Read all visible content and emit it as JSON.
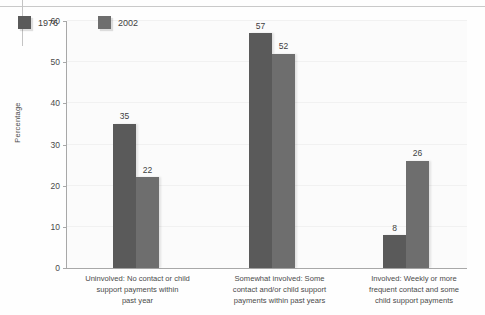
{
  "chart_data": {
    "type": "bar",
    "title": "",
    "subtitle": "",
    "xlabel": "",
    "ylabel": "Percentage",
    "ylim": [
      0,
      60
    ],
    "yticks": [
      0,
      10,
      20,
      30,
      40,
      50,
      60
    ],
    "grid": true,
    "legend_position": "top-left",
    "categories": [
      "Uninvolved: No contact or child support payments within past year",
      "Somewhat involved: Some contact and/or child support payments within past years",
      "Involved: Weekly or more frequent contact and some child support payments"
    ],
    "category_lines": [
      [
        "Uninvolved: No contact or child",
        "support payments within",
        "past year"
      ],
      [
        "Somewhat involved: Some",
        "contact and/or child support",
        "payments within past years"
      ],
      [
        "Involved: Weekly or more",
        "frequent contact and some",
        "child support payments"
      ]
    ],
    "series": [
      {
        "name": "1976",
        "values": [
          35,
          57,
          8
        ],
        "color": "#5a5a5a"
      },
      {
        "name": "2002",
        "values": [
          22,
          52,
          26
        ],
        "color": "#6e6e6e"
      }
    ]
  },
  "colors": {
    "series_1976": "#5a5a5a",
    "series_2002": "#6e6e6e",
    "axis": "#a8a8a8",
    "gridline": "#f1f1f1",
    "plot_background": "#fbfbfb",
    "text": "#4a4a4a",
    "rule": "#c9c9c9"
  }
}
